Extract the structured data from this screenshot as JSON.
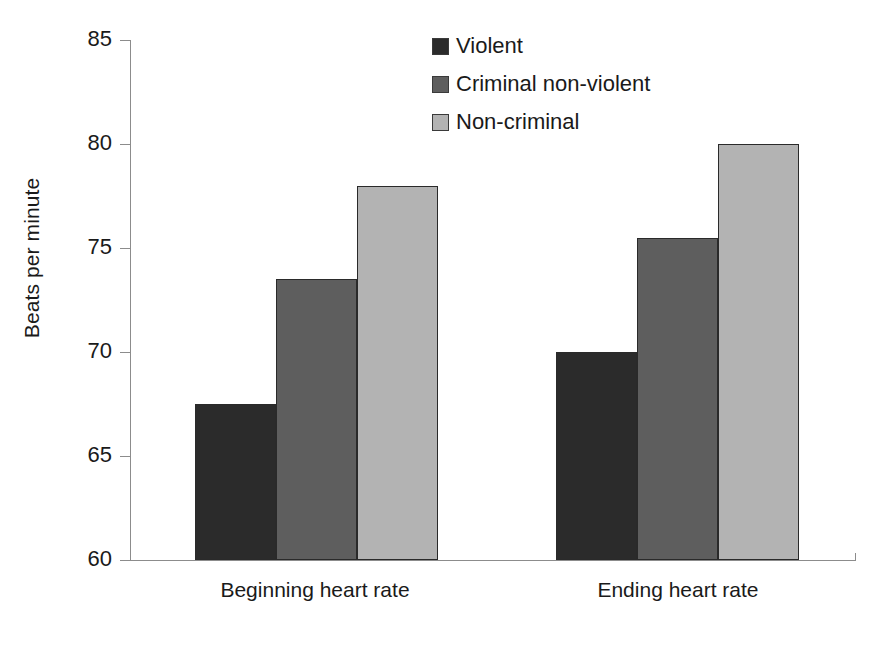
{
  "chart_data": {
    "type": "bar",
    "title": "",
    "xlabel": "",
    "ylabel": "Beats per minute",
    "categories": [
      "Beginning heart rate",
      "Ending heart rate"
    ],
    "series": [
      {
        "name": "Violent",
        "color": "#2b2b2b",
        "values": [
          67.5,
          70.0
        ]
      },
      {
        "name": "Criminal non-violent",
        "color": "#5e5e5e",
        "values": [
          73.5,
          75.5
        ]
      },
      {
        "name": "Non-criminal",
        "color": "#b3b3b3",
        "values": [
          78.0,
          80.0
        ]
      }
    ],
    "ylim": [
      60,
      85
    ],
    "yticks": [
      60,
      65,
      70,
      75,
      80,
      85
    ],
    "ytick_labels": [
      "60",
      "65",
      "70",
      "75",
      "80",
      "85"
    ],
    "grid": false,
    "legend_position": "top-right",
    "bar_outline_color": "#2a2a2a",
    "axis_color": "#8c8c8c",
    "background": "#ffffff"
  },
  "axis": {
    "y_title": "Beats per minute",
    "tick_60": "60",
    "tick_65": "65",
    "tick_70": "70",
    "tick_75": "75",
    "tick_80": "80",
    "tick_85": "85"
  },
  "categories": {
    "cat_0": "Beginning heart rate",
    "cat_1": "Ending heart rate"
  },
  "legend": {
    "item_0": "Violent",
    "item_1": "Criminal non-violent",
    "item_2": "Non-criminal"
  }
}
